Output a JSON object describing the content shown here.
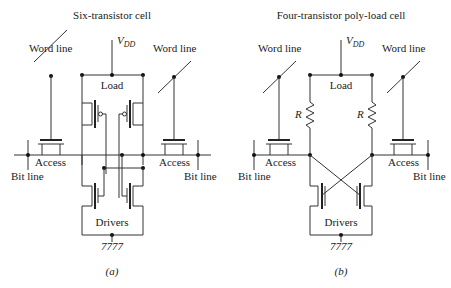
{
  "panel_a": {
    "title": "Six-transistor cell",
    "vdd": "V",
    "vdd_sub": "DD",
    "load": "Load",
    "word_line_left": "Word line",
    "word_line_right": "Word line",
    "access_left": "Access",
    "access_right": "Access",
    "bit_line_left": "Bit line",
    "bit_line_right": "Bit line",
    "drivers": "Drivers",
    "caption": "(a)"
  },
  "panel_b": {
    "title": "Four-transistor poly-load cell",
    "vdd": "V",
    "vdd_sub": "DD",
    "load": "Load",
    "resistor_left": "R",
    "resistor_right": "R",
    "word_line_left": "Word line",
    "word_line_right": "Word line",
    "access_left": "Access",
    "access_right": "Access",
    "bit_line_left": "Bit line",
    "bit_line_right": "Bit line",
    "drivers": "Drivers",
    "caption": "(b)"
  }
}
